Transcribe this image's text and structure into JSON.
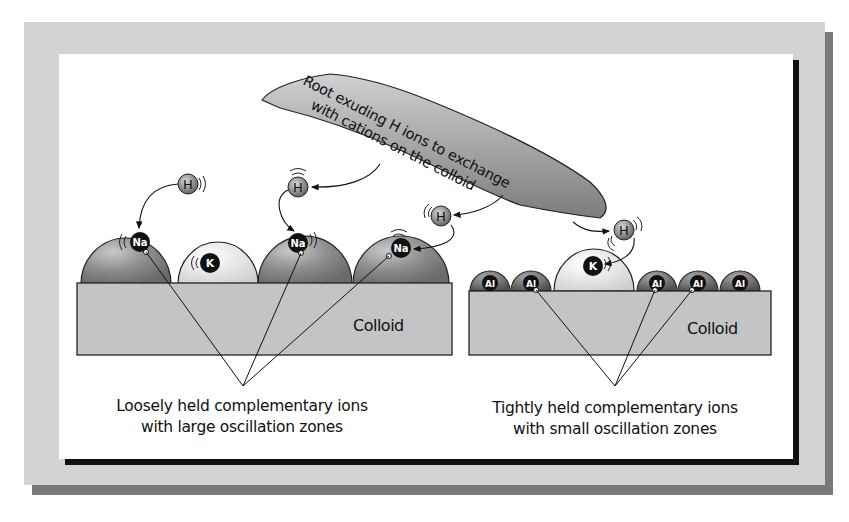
{
  "diagram": {
    "root_label": {
      "line1": "Root exuding H ions to exchange",
      "line2": "with cations on the colloid"
    },
    "left_panel": {
      "colloid_label": "Colloid",
      "caption_line1": "Loosely held complementary ions",
      "caption_line2": "with large oscillation zones",
      "ions": [
        {
          "symbol": "Na",
          "type": "large"
        },
        {
          "symbol": "K",
          "type": "light"
        },
        {
          "symbol": "Na",
          "type": "large"
        },
        {
          "symbol": "Na",
          "type": "large"
        }
      ]
    },
    "right_panel": {
      "colloid_label": "Colloid",
      "caption_line1": "Tightly held complementary ions",
      "caption_line2": "with small oscillation zones",
      "ions": [
        {
          "symbol": "Al"
        },
        {
          "symbol": "Al"
        },
        {
          "symbol": "K"
        },
        {
          "symbol": "Al"
        },
        {
          "symbol": "Al"
        },
        {
          "symbol": "Al"
        }
      ]
    },
    "hydrogen_ion_label": "H",
    "colors": {
      "frame": "#d3d3d3",
      "frame_shadow": "#7a7a7a",
      "colloid": "#c4c4c4",
      "large_ion": "#8f8f8f",
      "light_ion": "#e6e6e6",
      "ion_core": "#111111",
      "root": "#9a9a9a"
    }
  }
}
